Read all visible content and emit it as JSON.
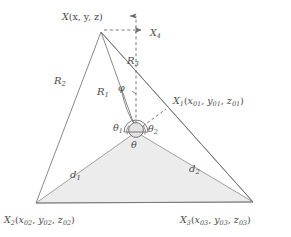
{
  "figure": {
    "name": "geometry-diagram-triangulation",
    "background_color": "#ffffff",
    "line_color": "#6b6b6b",
    "fill_color": "#ececec",
    "text_color": "#4a4a4a"
  },
  "points": {
    "x_top": {
      "base": "X",
      "sub": "",
      "coords": "(x, y, z)",
      "full": "X(x, y, z)"
    },
    "x1": {
      "base": "X",
      "sub": "1",
      "coords": "(x01, y01, z01)",
      "full": "X1(x01, y01, z01)"
    },
    "x2": {
      "base": "X",
      "sub": "2",
      "coords": "(x02, y02, z02)",
      "full": "X2(x02, y02, z02)"
    },
    "x3": {
      "base": "X",
      "sub": "3",
      "coords": "(x03, y03, z03)",
      "full": "X3(x03, y03, z03)"
    }
  },
  "axis": {
    "base": "X",
    "sub": "4",
    "full": "X4"
  },
  "ranges": {
    "r1": {
      "base": "R",
      "sub": "1"
    },
    "r2": {
      "base": "R",
      "sub": "2"
    },
    "r3": {
      "base": "R",
      "sub": "3"
    }
  },
  "baselines": {
    "d1": {
      "base": "d",
      "sub": "1"
    },
    "d2": {
      "base": "d",
      "sub": "2"
    }
  },
  "angles": {
    "theta1": {
      "base": "θ",
      "sub": "1"
    },
    "theta2": {
      "base": "θ",
      "sub": "2"
    },
    "theta": {
      "base": "θ",
      "sub": ""
    },
    "phi": {
      "base": "φ",
      "sub": ""
    }
  }
}
